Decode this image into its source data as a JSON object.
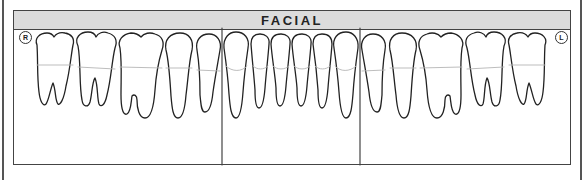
{
  "chart": {
    "title": "FACIAL",
    "arch": "mandibular",
    "view": "facial",
    "side_markers": {
      "patient_right": "R",
      "patient_left": "L"
    },
    "sections": [
      "posterior-right",
      "anterior",
      "posterior-left"
    ],
    "teeth": [
      {
        "name": "third-molar-right",
        "type": "molar"
      },
      {
        "name": "second-molar-right",
        "type": "molar"
      },
      {
        "name": "first-molar-right",
        "type": "molar"
      },
      {
        "name": "second-premolar-right",
        "type": "premolar"
      },
      {
        "name": "first-premolar-right",
        "type": "premolar"
      },
      {
        "name": "canine-right",
        "type": "canine"
      },
      {
        "name": "lateral-incisor-right",
        "type": "incisor"
      },
      {
        "name": "central-incisor-right",
        "type": "incisor"
      },
      {
        "name": "central-incisor-left",
        "type": "incisor"
      },
      {
        "name": "lateral-incisor-left",
        "type": "incisor"
      },
      {
        "name": "canine-left",
        "type": "canine"
      },
      {
        "name": "first-premolar-left",
        "type": "premolar"
      },
      {
        "name": "second-premolar-left",
        "type": "premolar"
      },
      {
        "name": "first-molar-left",
        "type": "molar"
      },
      {
        "name": "second-molar-left",
        "type": "molar"
      },
      {
        "name": "third-molar-left",
        "type": "molar"
      }
    ]
  },
  "colors": {
    "header_bg": "#dcdcdc",
    "outline": "#222222",
    "cej_line": "#b5b5b5",
    "border": "#444444"
  }
}
